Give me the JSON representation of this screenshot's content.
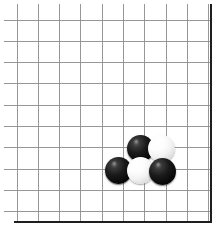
{
  "figure": {
    "board": {
      "background_color": "#ffffff",
      "grid_line_color": "#8c8c8c",
      "border_line_color": "#1e1e1e",
      "origin_x": 17,
      "origin_y": 20,
      "spacing": 21.3,
      "columns": 10,
      "rows": 10,
      "border_right_x": 211,
      "border_bottom_y": 222,
      "border_thickness": 2.5,
      "grid_thickness": 0.9
    },
    "stones": [
      {
        "id": "stone-1",
        "color": "black",
        "label": "black-stone",
        "col": 6,
        "row": 6,
        "cx": 140,
        "cy": 148,
        "diameter": 27
      },
      {
        "id": "stone-2",
        "color": "white",
        "label": "white-stone",
        "col": 7,
        "row": 6,
        "cx": 161,
        "cy": 148,
        "diameter": 27
      },
      {
        "id": "stone-3",
        "color": "black",
        "label": "black-stone",
        "col": 5,
        "row": 7,
        "cx": 118,
        "cy": 170,
        "diameter": 27
      },
      {
        "id": "stone-4",
        "color": "white",
        "label": "white-stone",
        "col": 6,
        "row": 7,
        "cx": 140,
        "cy": 170,
        "diameter": 27
      },
      {
        "id": "stone-5",
        "color": "black",
        "label": "black-stone",
        "col": 7,
        "row": 7,
        "cx": 162,
        "cy": 171,
        "diameter": 27
      }
    ],
    "stone_colors": {
      "black": "#000000",
      "white": "#ffffff"
    }
  }
}
